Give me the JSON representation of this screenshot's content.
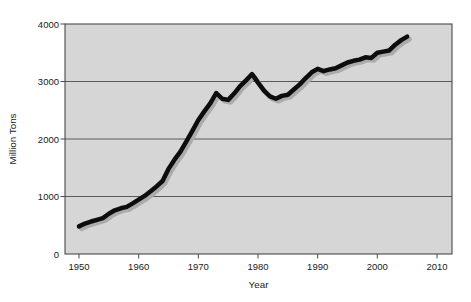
{
  "chart_data": {
    "type": "line",
    "xlabel": "Year",
    "ylabel": "Million Tons",
    "x_ticks": [
      1950,
      1960,
      1970,
      1980,
      1990,
      2000,
      2010
    ],
    "y_ticks": [
      0,
      1000,
      2000,
      3000,
      4000
    ],
    "xlim": [
      1947.6,
      2012.5
    ],
    "ylim": [
      0,
      4000
    ],
    "grid": "horizontal",
    "legend_position": "none",
    "plot_bg_color": "#d6d6d6",
    "border_color": "#4a4a4a",
    "grid_color": "#5a5a5a",
    "text_color": "#1a1a1a",
    "series": [
      {
        "name": "production-million-tons",
        "color": "#0d0d0d",
        "shadow_color": "#ababab",
        "x": [
          1950,
          1951,
          1952,
          1953,
          1954,
          1955,
          1956,
          1957,
          1958,
          1959,
          1960,
          1961,
          1962,
          1963,
          1964,
          1965,
          1966,
          1967,
          1968,
          1969,
          1970,
          1971,
          1972,
          1973,
          1974,
          1975,
          1976,
          1977,
          1978,
          1979,
          1980,
          1981,
          1982,
          1983,
          1984,
          1985,
          1986,
          1987,
          1988,
          1989,
          1990,
          1991,
          1992,
          1993,
          1994,
          1995,
          1996,
          1997,
          1998,
          1999,
          2000,
          2001,
          2002,
          2003,
          2004,
          2005
        ],
        "y": [
          480,
          530,
          565,
          595,
          625,
          700,
          760,
          795,
          820,
          880,
          945,
          1010,
          1090,
          1175,
          1270,
          1480,
          1640,
          1780,
          1960,
          2140,
          2330,
          2480,
          2620,
          2800,
          2700,
          2680,
          2790,
          2920,
          3020,
          3130,
          2980,
          2840,
          2740,
          2700,
          2750,
          2770,
          2860,
          2950,
          3060,
          3160,
          3220,
          3180,
          3210,
          3230,
          3280,
          3330,
          3360,
          3380,
          3420,
          3410,
          3500,
          3520,
          3540,
          3640,
          3720,
          3780
        ]
      }
    ]
  }
}
